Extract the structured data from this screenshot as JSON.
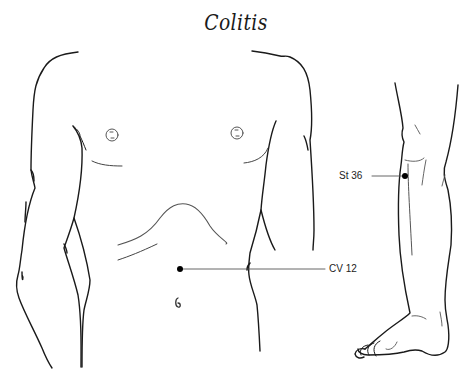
{
  "title": "Colitis",
  "points": [
    {
      "id": "cv12",
      "label": "CV 12",
      "dot": [
        180,
        269
      ],
      "line_end": [
        325,
        269
      ],
      "label_pos": [
        329,
        263
      ]
    },
    {
      "id": "st36",
      "label": "St 36",
      "dot": [
        405,
        176
      ],
      "line_end": [
        372,
        176
      ],
      "label_pos": [
        339,
        170
      ]
    }
  ],
  "colors": {
    "stroke": "#1a1a1a",
    "fine": "#555555",
    "dot": "#000000"
  }
}
